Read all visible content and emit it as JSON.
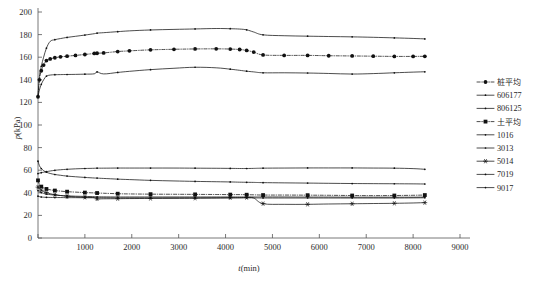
{
  "chart_data": {
    "type": "line",
    "title": "",
    "xlabel": "t(min)",
    "ylabel": "p(kPa)",
    "xlim": [
      0,
      9000
    ],
    "ylim": [
      0,
      200
    ],
    "xticks": [
      0,
      1000,
      2000,
      3000,
      4000,
      5000,
      6000,
      7000,
      8000,
      9000
    ],
    "yticks": [
      0,
      20,
      40,
      60,
      80,
      100,
      120,
      140,
      160,
      180,
      200
    ],
    "grid": false,
    "legend_position": "right",
    "x": [
      0,
      30,
      70,
      120,
      180,
      260,
      360,
      480,
      620,
      800,
      1000,
      1200,
      1260,
      1400,
      1700,
      1950,
      2400,
      2900,
      3350,
      3800,
      4100,
      4300,
      4450,
      4600,
      4800,
      5250,
      5750,
      6200,
      6700,
      7150,
      7600,
      8000,
      8250
    ],
    "series": [
      {
        "name": "桩平均",
        "linestyle": "dashdot",
        "marker": "circle-filled",
        "color": "#111111",
        "values": [
          125,
          140,
          148,
          153,
          157,
          158.5,
          159.5,
          160.3,
          160.9,
          161.6,
          162.4,
          163.3,
          163.5,
          163.8,
          165,
          165.6,
          166.5,
          167,
          167.3,
          167.4,
          167.2,
          166.8,
          166,
          164.5,
          162,
          161.6,
          161.6,
          161.3,
          161.1,
          160.9,
          160.7,
          160.7,
          160.8
        ]
      },
      {
        "name": "606177",
        "linestyle": "solid",
        "marker": "dot-small",
        "color": "#111111",
        "values": [
          125,
          143,
          152,
          160,
          168,
          174,
          175.5,
          176.5,
          177.5,
          178.5,
          179.6,
          180.8,
          181.3,
          181.7,
          182.6,
          183.3,
          184.1,
          184.6,
          185,
          185.4,
          185.2,
          184.9,
          184.2,
          182.3,
          179.8,
          179,
          178.6,
          178.3,
          178,
          177.6,
          177.1,
          176.6,
          176.2
        ]
      },
      {
        "name": "806125",
        "linestyle": "solid",
        "marker": "dot-small",
        "color": "#111111",
        "values": [
          125,
          131,
          136,
          140,
          143.2,
          144.2,
          144.5,
          144.6,
          144.7,
          144.8,
          145,
          145.3,
          147,
          145.2,
          146.5,
          147.5,
          149,
          150.2,
          151.1,
          150.6,
          149.4,
          148.4,
          147.6,
          147,
          146.2,
          146.2,
          146,
          145.6,
          145.1,
          145.5,
          146.2,
          146.8,
          147.1
        ]
      },
      {
        "name": "土平均",
        "linestyle": "dashdot",
        "marker": "square-filled",
        "color": "#111111",
        "values": [
          51,
          47.5,
          45.5,
          44.3,
          43.4,
          42.7,
          42,
          41.5,
          41,
          40.6,
          40.2,
          39.9,
          39.8,
          39.6,
          39.2,
          39,
          38.8,
          38.7,
          38.6,
          38.5,
          38.4,
          38.4,
          38.3,
          38.2,
          38,
          38,
          37.9,
          37.8,
          37.6,
          37.5,
          37.6,
          37.8,
          38
        ]
      },
      {
        "name": "1016",
        "linestyle": "solid",
        "marker": "dot-small",
        "color": "#111111",
        "values": [
          57,
          57.4,
          57.8,
          58.2,
          58.7,
          59.3,
          59.9,
          60.4,
          60.8,
          61.2,
          61.5,
          61.7,
          61.8,
          61.8,
          61.9,
          61.9,
          61.9,
          61.9,
          61.8,
          61.7,
          61.6,
          61.5,
          61.5,
          61.6,
          61.8,
          61.9,
          62,
          62,
          62,
          61.9,
          61.8,
          61.4,
          60.8
        ]
      },
      {
        "name": "3013",
        "linestyle": "solid",
        "marker": "dot-small",
        "color": "#111111",
        "values": [
          68,
          64,
          61.5,
          59.6,
          58.2,
          57.1,
          56.2,
          55.5,
          54.8,
          54.2,
          53.6,
          53.1,
          53,
          52.7,
          52.1,
          51.7,
          51,
          50.5,
          50.1,
          49.8,
          49.6,
          49.4,
          49.3,
          49.2,
          49,
          48.8,
          48.6,
          48.4,
          48.2,
          48.1,
          48,
          47.9,
          47.8
        ]
      },
      {
        "name": "5014",
        "linestyle": "solid",
        "marker": "star",
        "color": "#111111",
        "values": [
          45,
          43.5,
          42.3,
          41.2,
          40.2,
          39.2,
          38.3,
          37.6,
          37,
          36.4,
          36,
          35.7,
          34.6,
          34.7,
          34.8,
          34.9,
          35,
          35.1,
          35.2,
          35.4,
          35.6,
          35.7,
          35.8,
          35.4,
          30.4,
          29.8,
          29.8,
          30.1,
          30.3,
          30.5,
          30.7,
          31,
          31.3
        ]
      },
      {
        "name": "7019",
        "linestyle": "solid",
        "marker": "dot-small",
        "color": "#111111",
        "values": [
          42,
          41,
          40.2,
          39.5,
          38.9,
          38.4,
          38,
          37.6,
          37.3,
          37,
          36.8,
          36.6,
          36.5,
          36.4,
          36.3,
          36.3,
          36.3,
          36.3,
          36.3,
          36.3,
          36.3,
          36.3,
          36.3,
          36.3,
          36.3,
          36.3,
          36.2,
          36.2,
          36.1,
          36.1,
          36.1,
          36.1,
          36.2
        ]
      },
      {
        "name": "9017",
        "linestyle": "solid",
        "marker": "dot-small",
        "color": "#111111",
        "values": [
          37,
          36.6,
          36.3,
          36.1,
          36,
          35.9,
          35.8,
          35.8,
          35.7,
          35.7,
          35.6,
          35.6,
          35.6,
          35.6,
          35.5,
          35.5,
          35.5,
          35.5,
          35.5,
          35.5,
          35.5,
          35.5,
          35.5,
          35.5,
          35.4,
          35.4,
          35.4,
          35.4,
          35.4,
          35.4,
          35.4,
          35.5,
          35.6
        ]
      }
    ]
  },
  "legend": {
    "entries": [
      {
        "label": "桩平均"
      },
      {
        "label": "606177"
      },
      {
        "label": "806125"
      },
      {
        "label": "土平均"
      },
      {
        "label": "1016"
      },
      {
        "label": "3013"
      },
      {
        "label": "5014"
      },
      {
        "label": "7019"
      },
      {
        "label": "9017"
      }
    ]
  }
}
